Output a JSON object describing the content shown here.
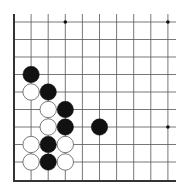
{
  "board": {
    "description": "Go board diagram, lower-left corner region",
    "grid": {
      "origin_x": 14,
      "origin_y": 22,
      "step_x": 17.1,
      "step_y": 17.5,
      "cols": 10,
      "rows": 9,
      "bottom_edge_y": 181,
      "right_extent_x": 176,
      "line_color": "#555555",
      "edge_color": "#333333"
    },
    "star_points": [
      {
        "col": 3,
        "row": 0
      },
      {
        "col": 9,
        "row": 0
      },
      {
        "col": 9,
        "row": 6
      }
    ],
    "stones": [
      {
        "color": "black",
        "col": 1,
        "row": 3
      },
      {
        "color": "white",
        "col": 1,
        "row": 4
      },
      {
        "color": "black",
        "col": 2,
        "row": 4
      },
      {
        "color": "white",
        "col": 2,
        "row": 5
      },
      {
        "color": "black",
        "col": 3,
        "row": 5
      },
      {
        "color": "white",
        "col": 2,
        "row": 6
      },
      {
        "color": "black",
        "col": 3,
        "row": 6
      },
      {
        "color": "black",
        "col": 5,
        "row": 6
      },
      {
        "color": "white",
        "col": 1,
        "row": 7
      },
      {
        "color": "black",
        "col": 2,
        "row": 7
      },
      {
        "color": "white",
        "col": 3,
        "row": 7
      },
      {
        "color": "white",
        "col": 1,
        "row": 8
      },
      {
        "color": "black",
        "col": 2,
        "row": 8
      },
      {
        "color": "white",
        "col": 3,
        "row": 8
      }
    ],
    "colors": {
      "black_stone": "#111111",
      "white_stone": "#ffffff",
      "white_stone_outline": "#444444",
      "background": "#ffffff"
    }
  }
}
